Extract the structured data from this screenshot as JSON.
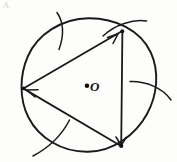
{
  "figure": {
    "kind": "geometry-construction-sketch",
    "center_label": "O",
    "corner_mark": "A.",
    "ink_color": "#1a1a1a",
    "background_color": "#fdfdfc",
    "canvas": {
      "width": 177,
      "height": 162
    },
    "circle": {
      "cx": 88.5,
      "cy": 85.0,
      "r": 67.0
    },
    "center_point": {
      "x": 87.0,
      "y": 86.0
    },
    "triangle": {
      "vertices": [
        {
          "name": "left-vertex",
          "x": 23.5,
          "y": 88.0
        },
        {
          "name": "top-right-vertex",
          "x": 122.0,
          "y": 31.0
        },
        {
          "name": "bottom-right-vertex",
          "x": 121.0,
          "y": 146.0
        }
      ],
      "edges": [
        {
          "name": "edge-left-to-top",
          "arrow": true
        },
        {
          "name": "edge-bottom-to-left",
          "arrow": true
        },
        {
          "name": "edge-right-vertical",
          "arrow": false
        }
      ]
    },
    "construction_arcs": [
      {
        "name": "arc-top-left",
        "sweep": "crosses circle near upper-left"
      },
      {
        "name": "arc-top-right",
        "sweep": "crosses circle near top-right vertex"
      },
      {
        "name": "arc-right",
        "sweep": "crosses circle on the right side"
      },
      {
        "name": "arc-bottom-left",
        "sweep": "crosses circle near bottom-left"
      }
    ]
  }
}
